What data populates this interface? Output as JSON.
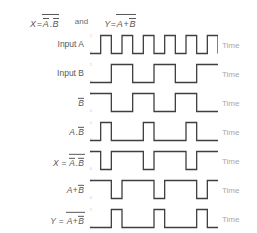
{
  "header": {
    "equation_x": {
      "lhs": "X",
      "equals": "=",
      "operand_a": "A",
      "operand_b": "B",
      "operator": ".",
      "full_text": "X = (A̅.B̅)̅"
    },
    "conjunction": "and",
    "equation_y": {
      "lhs": "Y",
      "equals": "=",
      "operand_a": "A",
      "operand_b": "B",
      "operator": "+",
      "full_text": "Y = (A+B̅)̅"
    }
  },
  "axis": {
    "high_level": "1",
    "low_level": "0",
    "time_label": "Time"
  },
  "chart_data": {
    "type": "line",
    "xlabel": "Time",
    "ylabel": "Logic level",
    "ylim": [
      0,
      1
    ],
    "grid": false,
    "legend": "none",
    "time_units": 12,
    "series": [
      {
        "name": "Input A",
        "label_html": "Input A",
        "values": [
          0,
          1,
          0,
          1,
          0,
          1,
          0,
          1,
          0,
          1,
          0,
          1,
          0
        ]
      },
      {
        "name": "Input B",
        "label_html": "Input B",
        "values": [
          0,
          0,
          1,
          1,
          0,
          0,
          1,
          1,
          0,
          0,
          1,
          1,
          1
        ]
      },
      {
        "name": "B-bar",
        "label_html": "B̅",
        "values": [
          1,
          1,
          0,
          0,
          1,
          1,
          0,
          0,
          1,
          1,
          0,
          0,
          0
        ]
      },
      {
        "name": "A AND B-bar",
        "label_html": "A.B̅",
        "values": [
          0,
          1,
          0,
          0,
          0,
          1,
          0,
          0,
          0,
          1,
          0,
          0,
          0
        ]
      },
      {
        "name": "X = NOT (A AND B-bar)",
        "label_html": "X = (A.B̅)̅",
        "values": [
          1,
          0,
          1,
          1,
          1,
          0,
          1,
          1,
          1,
          0,
          1,
          1,
          1
        ]
      },
      {
        "name": "A OR B-bar",
        "label_html": "A+B̅",
        "values": [
          1,
          1,
          0,
          1,
          1,
          1,
          0,
          1,
          1,
          1,
          0,
          1,
          1
        ]
      },
      {
        "name": "Y = NOT (A OR B-bar)",
        "label_html": "Y = (A+B̅)̅",
        "values": [
          0,
          0,
          1,
          0,
          0,
          0,
          1,
          0,
          0,
          0,
          1,
          0,
          0
        ]
      }
    ]
  }
}
